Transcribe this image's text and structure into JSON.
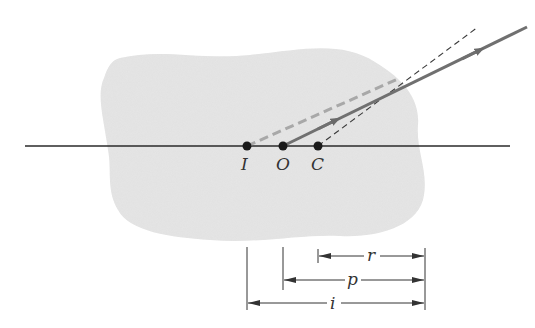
{
  "diagram": {
    "type": "refraction-spherical-surface",
    "colors": {
      "background": "#ffffff",
      "medium": "#e6e6e6",
      "axis": "#2a2a2a",
      "ray": "#707070",
      "virtual_ray": "#a8a8a8",
      "normal_line": "#3a3a3a",
      "point": "#1a1a1a",
      "dimension": "#333333"
    },
    "points": [
      {
        "id": "I",
        "label": "I",
        "x": 247
      },
      {
        "id": "O",
        "label": "O",
        "x": 283
      },
      {
        "id": "C",
        "label": "C",
        "x": 318
      }
    ],
    "dimensions": [
      {
        "id": "r",
        "label": "r",
        "from": "C",
        "to": "surface"
      },
      {
        "id": "p",
        "label": "p",
        "from": "O",
        "to": "surface"
      },
      {
        "id": "i",
        "label": "i",
        "from": "I",
        "to": "surface"
      }
    ]
  }
}
